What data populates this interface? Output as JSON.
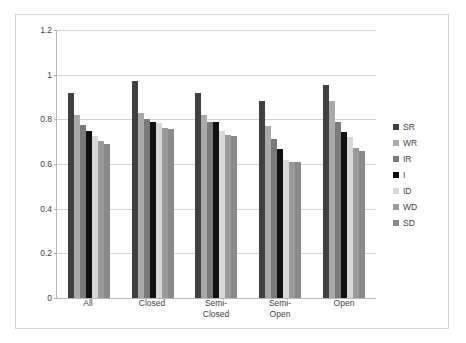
{
  "chart_data": {
    "type": "bar",
    "title": "",
    "subtitle": "",
    "xlabel": "",
    "ylabel": "",
    "categories": [
      "All",
      "Closed",
      "Semi-\nClosed",
      "Semi-\nOpen",
      "Open"
    ],
    "ylim": [
      0,
      1.2
    ],
    "yticks": [
      0,
      0.2,
      0.4,
      0.6,
      0.8,
      1,
      1.2
    ],
    "ytick_labels": [
      "0",
      "0.2",
      "0.4",
      "0.6",
      "0.8",
      "1",
      "1.2"
    ],
    "grid": true,
    "legend_position": "right",
    "series": [
      {
        "name": "SR",
        "color": "#404040",
        "values": [
          0.92,
          0.97,
          0.92,
          0.88,
          0.955
        ]
      },
      {
        "name": "WR",
        "color": "#aaaaaa",
        "values": [
          0.82,
          0.83,
          0.82,
          0.77,
          0.88
        ]
      },
      {
        "name": "IR",
        "color": "#7a7a7a",
        "values": [
          0.775,
          0.8,
          0.79,
          0.71,
          0.79
        ]
      },
      {
        "name": "I",
        "color": "#111111",
        "values": [
          0.75,
          0.79,
          0.79,
          0.665,
          0.745
        ]
      },
      {
        "name": "ID",
        "color": "#d8d8d8",
        "values": [
          0.725,
          0.785,
          0.75,
          0.62,
          0.72
        ]
      },
      {
        "name": "WD",
        "color": "#9a9a9a",
        "values": [
          0.705,
          0.76,
          0.73,
          0.61,
          0.67
        ]
      },
      {
        "name": "SD",
        "color": "#8a8a8a",
        "values": [
          0.69,
          0.758,
          0.725,
          0.61,
          0.66
        ]
      }
    ]
  },
  "legend": {
    "items": [
      {
        "label": "SR"
      },
      {
        "label": "WR"
      },
      {
        "label": "IR"
      },
      {
        "label": "I"
      },
      {
        "label": "ID"
      },
      {
        "label": "WD"
      },
      {
        "label": "SD"
      }
    ]
  }
}
